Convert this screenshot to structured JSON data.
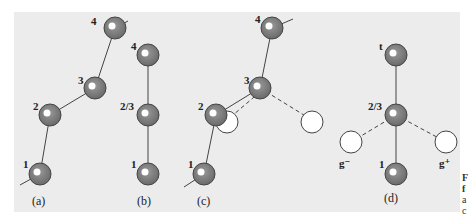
{
  "colors": {
    "panel": "#ececec",
    "atom_fill": "#7a7a7a",
    "atom_stroke": "#444444",
    "atom_highlight": "#ffffff",
    "open_atom_fill": "#ffffff",
    "bond": "#444444"
  },
  "panels": [
    {
      "id": "a",
      "label": "(a)",
      "atoms": [
        {
          "label": "4",
          "x": 115,
          "y": 28
        },
        {
          "label": "3",
          "x": 95,
          "y": 88
        },
        {
          "label": "2",
          "x": 50,
          "y": 115
        },
        {
          "label": "1",
          "x": 40,
          "y": 174
        }
      ]
    },
    {
      "id": "b",
      "label": "(b)",
      "atoms": [
        {
          "label": "4",
          "x": 148,
          "y": 55
        },
        {
          "label": "2/3",
          "x": 148,
          "y": 115
        },
        {
          "label": "1",
          "x": 148,
          "y": 174
        }
      ]
    },
    {
      "id": "c",
      "label": "(c)",
      "atoms": [
        {
          "label": "4",
          "x": 272,
          "y": 28
        },
        {
          "label": "3",
          "x": 260,
          "y": 88
        },
        {
          "label": "2",
          "x": 216,
          "y": 115
        },
        {
          "label": "1",
          "x": 204,
          "y": 174
        }
      ]
    },
    {
      "id": "d",
      "label": "(d)",
      "atoms": [
        {
          "label": "t",
          "x": 396,
          "y": 55
        },
        {
          "label": "2/3",
          "x": 396,
          "y": 115
        },
        {
          "label": "1",
          "x": 396,
          "y": 174
        }
      ],
      "open_atoms": [
        {
          "label": "g⁻",
          "x": 351,
          "y": 142
        },
        {
          "label": "g⁺",
          "x": 446,
          "y": 142
        }
      ]
    }
  ],
  "caption_fragment": [
    "F",
    "f",
    "a",
    "c"
  ]
}
